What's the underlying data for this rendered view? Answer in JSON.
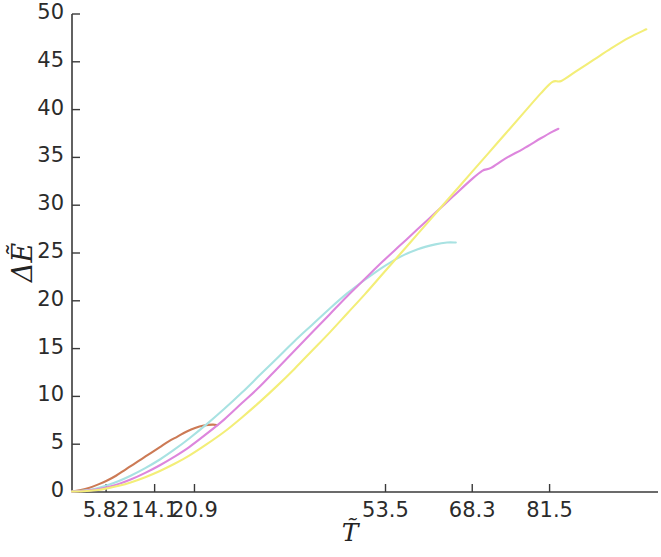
{
  "chart_data": {
    "type": "line",
    "title": "",
    "xlabel": "T̃",
    "ylabel": "ΔẼ",
    "xlim": [
      0,
      100
    ],
    "ylim": [
      0,
      50
    ],
    "grid": false,
    "legend": "none",
    "x_ticks": [
      {
        "value": 5.82,
        "label": "5.82"
      },
      {
        "value": 14.1,
        "label": "14.1"
      },
      {
        "value": 20.9,
        "label": "20.9"
      },
      {
        "value": 53.5,
        "label": "53.5"
      },
      {
        "value": 68.3,
        "label": "68.3"
      },
      {
        "value": 81.5,
        "label": "81.5"
      }
    ],
    "y_ticks": [
      {
        "value": 0,
        "label": "0"
      },
      {
        "value": 5,
        "label": "5"
      },
      {
        "value": 10,
        "label": "10"
      },
      {
        "value": 15,
        "label": "15"
      },
      {
        "value": 20,
        "label": "20"
      },
      {
        "value": 25,
        "label": "25"
      },
      {
        "value": 30,
        "label": "30"
      },
      {
        "value": 35,
        "label": "35"
      },
      {
        "value": 40,
        "label": "40"
      },
      {
        "value": 45,
        "label": "45"
      },
      {
        "value": 50,
        "label": "50"
      }
    ],
    "series": [
      {
        "name": "salmon-curve",
        "color": "#cc7a55",
        "points": [
          [
            0.0,
            0.05
          ],
          [
            1.5,
            0.2
          ],
          [
            3.0,
            0.45
          ],
          [
            4.5,
            0.8
          ],
          [
            6.0,
            1.2
          ],
          [
            7.5,
            1.7
          ],
          [
            9.0,
            2.3
          ],
          [
            10.5,
            2.9
          ],
          [
            12.0,
            3.5
          ],
          [
            13.5,
            4.1
          ],
          [
            15.0,
            4.7
          ],
          [
            16.5,
            5.3
          ],
          [
            18.0,
            5.8
          ],
          [
            19.5,
            6.3
          ],
          [
            21.0,
            6.7
          ],
          [
            22.5,
            6.95
          ],
          [
            24.0,
            7.05
          ],
          [
            24.8,
            7.0
          ]
        ]
      },
      {
        "name": "cyan-curve",
        "color": "#a8e2e2",
        "points": [
          [
            0.0,
            0.05
          ],
          [
            2.0,
            0.15
          ],
          [
            4.0,
            0.35
          ],
          [
            6.0,
            0.7
          ],
          [
            8.0,
            1.15
          ],
          [
            10.0,
            1.7
          ],
          [
            12.5,
            2.5
          ],
          [
            15.0,
            3.4
          ],
          [
            17.5,
            4.45
          ],
          [
            20.0,
            5.6
          ],
          [
            23.0,
            7.1
          ],
          [
            26.0,
            8.7
          ],
          [
            29.0,
            10.4
          ],
          [
            32.0,
            12.2
          ],
          [
            35.0,
            14.0
          ],
          [
            38.0,
            15.8
          ],
          [
            41.0,
            17.5
          ],
          [
            44.0,
            19.2
          ],
          [
            47.0,
            20.8
          ],
          [
            50.0,
            22.2
          ],
          [
            53.0,
            23.5
          ],
          [
            56.0,
            24.6
          ],
          [
            59.0,
            25.4
          ],
          [
            62.0,
            25.9
          ],
          [
            64.0,
            26.1
          ],
          [
            65.5,
            26.1
          ]
        ]
      },
      {
        "name": "magenta-curve",
        "color": "#dd86dd",
        "points": [
          [
            0.0,
            0.05
          ],
          [
            2.0,
            0.1
          ],
          [
            4.0,
            0.25
          ],
          [
            6.0,
            0.5
          ],
          [
            8.0,
            0.85
          ],
          [
            10.0,
            1.3
          ],
          [
            12.5,
            2.0
          ],
          [
            15.0,
            2.8
          ],
          [
            17.5,
            3.7
          ],
          [
            20.0,
            4.7
          ],
          [
            23.0,
            6.1
          ],
          [
            26.0,
            7.6
          ],
          [
            29.0,
            9.3
          ],
          [
            32.0,
            11.0
          ],
          [
            35.0,
            12.9
          ],
          [
            38.0,
            14.8
          ],
          [
            41.0,
            16.7
          ],
          [
            44.0,
            18.6
          ],
          [
            47.0,
            20.5
          ],
          [
            50.0,
            22.3
          ],
          [
            53.0,
            24.1
          ],
          [
            56.0,
            25.8
          ],
          [
            59.0,
            27.5
          ],
          [
            62.0,
            29.2
          ],
          [
            65.0,
            30.9
          ],
          [
            68.0,
            32.6
          ],
          [
            70.0,
            33.6
          ],
          [
            71.5,
            33.9
          ],
          [
            74.0,
            34.9
          ],
          [
            77.0,
            35.9
          ],
          [
            80.0,
            37.0
          ],
          [
            82.0,
            37.7
          ],
          [
            83.0,
            38.0
          ]
        ]
      },
      {
        "name": "yellow-curve",
        "color": "#f3ee78",
        "points": [
          [
            0.0,
            0.05
          ],
          [
            2.0,
            0.08
          ],
          [
            4.0,
            0.18
          ],
          [
            6.0,
            0.38
          ],
          [
            8.0,
            0.65
          ],
          [
            10.0,
            1.0
          ],
          [
            12.5,
            1.55
          ],
          [
            15.0,
            2.2
          ],
          [
            17.5,
            2.95
          ],
          [
            20.0,
            3.8
          ],
          [
            23.0,
            5.0
          ],
          [
            26.0,
            6.3
          ],
          [
            29.0,
            7.8
          ],
          [
            32.0,
            9.4
          ],
          [
            35.0,
            11.1
          ],
          [
            38.0,
            12.9
          ],
          [
            41.0,
            14.8
          ],
          [
            44.0,
            16.7
          ],
          [
            47.0,
            18.7
          ],
          [
            50.0,
            20.7
          ],
          [
            53.0,
            22.8
          ],
          [
            56.0,
            24.9
          ],
          [
            59.0,
            27.0
          ],
          [
            62.0,
            29.1
          ],
          [
            65.0,
            31.2
          ],
          [
            68.0,
            33.3
          ],
          [
            71.0,
            35.4
          ],
          [
            74.0,
            37.5
          ],
          [
            77.0,
            39.6
          ],
          [
            80.0,
            41.7
          ],
          [
            82.0,
            42.9
          ],
          [
            83.5,
            43.0
          ],
          [
            86.0,
            44.0
          ],
          [
            89.0,
            45.2
          ],
          [
            92.0,
            46.4
          ],
          [
            95.0,
            47.5
          ],
          [
            98.0,
            48.4
          ]
        ]
      }
    ]
  },
  "axes": {
    "x_axis_name": "x-axis",
    "y_axis_name": "y-axis"
  }
}
